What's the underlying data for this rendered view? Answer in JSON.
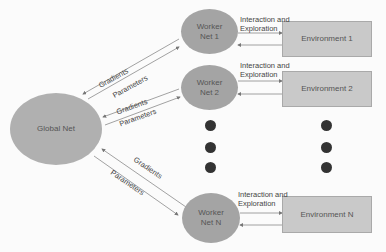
{
  "diagram": {
    "global_net": {
      "label": "Global Net"
    },
    "workers": [
      {
        "label": "Worker Net 1",
        "line1": "Worker",
        "line2": "Net 1",
        "env": "Environment 1",
        "interaction": [
          "Interaction and",
          "Exploration"
        ],
        "to_global": "Gradients",
        "from_global": "Parameters"
      },
      {
        "label": "Worker Net 2",
        "line1": "Worker",
        "line2": "Net 2",
        "env": "Environment 2",
        "interaction": [
          "Interaction and",
          "Exploration"
        ],
        "to_global": "Gradients",
        "from_global": "Parameters"
      },
      {
        "label": "Worker Net N",
        "line1": "Worker",
        "line2": "Net N",
        "env": "Environment N",
        "interaction": [
          "Interaction and",
          "Exploration"
        ],
        "to_global": "Gradients",
        "from_global": "Parameters"
      }
    ],
    "ellipsis_dots": 3,
    "colors": {
      "node_fill": "#a4a4a4",
      "box_fill": "#c9c9c9",
      "dot": "#333333",
      "line": "#888888"
    }
  }
}
